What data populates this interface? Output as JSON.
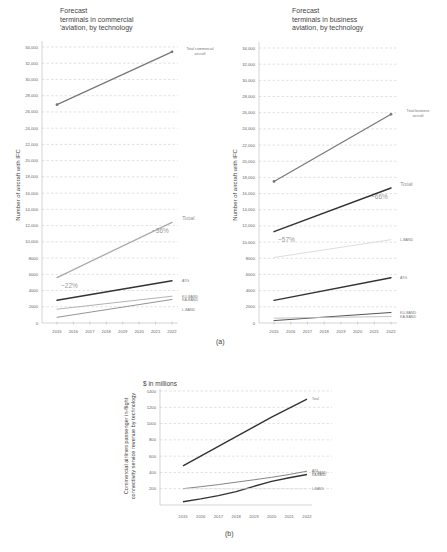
{
  "chart_data": [
    {
      "id": "a-left",
      "type": "line",
      "title": "Forecast terminals in commercial 'aviation, by technology",
      "title_lines": [
        "Forecast",
        "terminals in commercial",
        "'aviation, by technology"
      ],
      "xlabel": "",
      "ylabel": "Number of aircraft with IFC",
      "x": [
        2015,
        2016,
        2017,
        2018,
        2019,
        2020,
        2021,
        2022
      ],
      "yticks": [
        0,
        2000,
        4000,
        6000,
        8000,
        10000,
        12000,
        14000,
        16000,
        18000,
        20000,
        22000,
        24000,
        26000,
        28000,
        30000,
        32000,
        34000
      ],
      "ytick_labels": [
        "0",
        "2000",
        "4000",
        "6000",
        "8000",
        "10,000",
        "12,000",
        "14,000",
        "16,000",
        "18,000",
        "20,000",
        "22,000",
        "24,000",
        "26,000",
        "28,000",
        "30,000",
        "32,000",
        "34,000"
      ],
      "ylim": [
        0,
        34000
      ],
      "grid": true,
      "series": [
        {
          "name": "Total commercial aircraft",
          "label_lines": [
            "Total commercial",
            "aircraft"
          ],
          "start": [
            2015,
            26900
          ],
          "end": [
            2022,
            33400
          ],
          "color": "#777777",
          "width": 1.2,
          "markers": true
        },
        {
          "name": "Total",
          "start": [
            2015,
            5600
          ],
          "end": [
            2022,
            12400
          ],
          "color": "#aaaaaa",
          "width": 1.3
        },
        {
          "name": "ATG",
          "start": [
            2015,
            2800
          ],
          "end": [
            2022,
            5200
          ],
          "color": "#333333",
          "width": 1.4
        },
        {
          "name": "KU-BAND",
          "start": [
            2015,
            1700
          ],
          "end": [
            2022,
            3300
          ],
          "color": "#aaaaaa",
          "width": 0.9
        },
        {
          "name": "KA-BAND",
          "start": [
            2015,
            700
          ],
          "end": [
            2022,
            2900
          ],
          "color": "#888888",
          "width": 0.9
        },
        {
          "name": "L-BAND",
          "start": null,
          "end": null,
          "color": "#aaaaaa",
          "label_only": true,
          "label_y": 1700
        }
      ],
      "annotations": [
        {
          "text": "~22%",
          "x": 2015,
          "y": 5600
        },
        {
          "text": "~36%",
          "x": 2022,
          "y": 12400
        }
      ]
    },
    {
      "id": "a-right",
      "type": "line",
      "title": "Forecast terminals in business aviation, by technology",
      "title_lines": [
        "Forecast",
        "terminals in business",
        "aviation, by technology"
      ],
      "xlabel": "",
      "ylabel": "Number of aircraft with IFC",
      "x": [
        2015,
        2016,
        2017,
        2018,
        2019,
        2020,
        2021,
        2022
      ],
      "yticks": [
        0,
        2000,
        4000,
        6000,
        8000,
        10000,
        12000,
        14000,
        16000,
        18000,
        20000,
        22000,
        24000,
        26000,
        28000,
        30000,
        32000,
        34000
      ],
      "ytick_labels": [
        "0",
        "2000",
        "4000",
        "6000",
        "8000",
        "10,000",
        "12,000",
        "14,000",
        "16,000",
        "18,000",
        "20,000",
        "22,000",
        "24,000",
        "26,000",
        "28,000",
        "30,000",
        "32,000",
        "34,000"
      ],
      "ylim": [
        0,
        34000
      ],
      "grid": true,
      "series": [
        {
          "name": "Total business aircraft",
          "label_lines": [
            "Total business",
            "aircraft"
          ],
          "start": [
            2015,
            17500
          ],
          "end": [
            2022,
            25800
          ],
          "color": "#777777",
          "width": 1.2,
          "markers": true
        },
        {
          "name": "Total",
          "start": [
            2015,
            11300
          ],
          "end": [
            2022,
            16700
          ],
          "color": "#333333",
          "width": 1.5
        },
        {
          "name": "L-BAND",
          "start": [
            2015,
            8100
          ],
          "end": [
            2022,
            10300
          ],
          "color": "#dddddd",
          "width": 1.0
        },
        {
          "name": "ATG",
          "start": [
            2015,
            2800
          ],
          "end": [
            2022,
            5600
          ],
          "color": "#333333",
          "width": 1.4
        },
        {
          "name": "KU-BAND",
          "start": [
            2015,
            300
          ],
          "end": [
            2022,
            1300
          ],
          "color": "#555555",
          "width": 1.0
        },
        {
          "name": "KA-BAND",
          "start": [
            2015,
            600
          ],
          "end": [
            2022,
            800
          ],
          "color": "#bbbbbb",
          "width": 0.9
        }
      ],
      "annotations": [
        {
          "text": "~57%",
          "x": 2015,
          "y": 11300
        },
        {
          "text": "~66%",
          "x": 2022,
          "y": 16700
        }
      ]
    },
    {
      "id": "b",
      "type": "line",
      "title": "$ in millions",
      "xlabel": "",
      "ylabel": "Commercial airlines passenger in-flight connectivity service revenue by technology",
      "ylabel_lines": [
        "Commercial airlines passenger in-flight",
        "connectivity service revenue by technology"
      ],
      "x": [
        2015,
        2016,
        2017,
        2018,
        2019,
        2020,
        2021,
        2022
      ],
      "yticks": [
        200,
        400,
        600,
        800,
        1000,
        1200,
        1400
      ],
      "ytick_labels": [
        "200",
        "400",
        "600",
        "800",
        "1000",
        "1200",
        "1400"
      ],
      "ylim": [
        0,
        1400
      ],
      "grid": true,
      "series": [
        {
          "name": "Total",
          "values": [
            480,
            600,
            720,
            840,
            960,
            1080,
            1190,
            1300
          ],
          "color": "#333333",
          "width": 1.4
        },
        {
          "name": "ATG",
          "values": [
            200,
            225,
            250,
            280,
            310,
            340,
            375,
            415
          ],
          "color": "#777777",
          "width": 0.9
        },
        {
          "name": "KU-BAND",
          "values": [
            40,
            75,
            115,
            165,
            230,
            290,
            335,
            375
          ],
          "color": "#333333",
          "width": 1.4
        },
        {
          "name": "KA-BAND",
          "label_only": true
        },
        {
          "name": "L-BAND",
          "values": [
            200,
            200,
            200,
            200,
            200,
            200,
            200,
            200
          ],
          "color": "#dddddd",
          "width": 0.6,
          "faint": true
        }
      ]
    }
  ],
  "captions": {
    "a": "(a)",
    "b": "(b)"
  }
}
